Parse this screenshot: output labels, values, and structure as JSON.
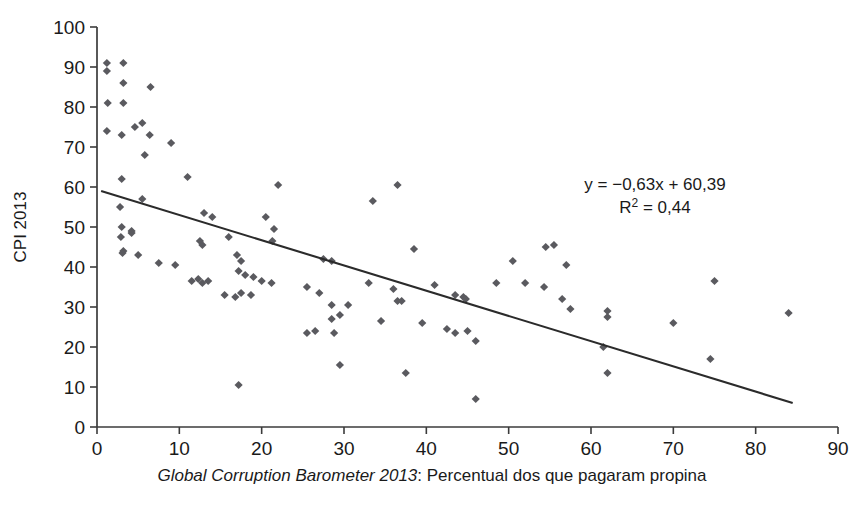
{
  "chart_data": {
    "type": "scatter",
    "title_visible_fragment": "",
    "xlabel_italic": "Global Corruption Barometer 2013",
    "xlabel_rest": ": Percentual dos que pagaram propina",
    "ylabel": "CPI 2013",
    "xlim": [
      0,
      90
    ],
    "ylim": [
      0,
      100
    ],
    "xticks": [
      0,
      10,
      20,
      30,
      40,
      50,
      60,
      70,
      80,
      90
    ],
    "yticks": [
      0,
      10,
      20,
      30,
      40,
      50,
      60,
      70,
      80,
      90,
      100
    ],
    "grid": false,
    "legend": "none",
    "marker_shape": "diamond",
    "marker_color": "#5a5a5f",
    "line_color": "#2b2b2b",
    "annotations": [
      "y = −0,63x + 60,39",
      "R² = 0,44"
    ],
    "equation": {
      "slope": -0.63,
      "intercept": 60.39,
      "r_squared": 0.44,
      "line_x_start": 0.5,
      "line_y_start": 59.0,
      "line_x_end": 84.5,
      "line_y_end": 6.0
    },
    "points": [
      [
        1.2,
        91.0
      ],
      [
        1.2,
        89.0
      ],
      [
        3.2,
        91.0
      ],
      [
        1.3,
        81.0
      ],
      [
        3.2,
        86.0
      ],
      [
        3.2,
        81.0
      ],
      [
        6.5,
        85.0
      ],
      [
        1.2,
        74.0
      ],
      [
        3.0,
        73.0
      ],
      [
        4.6,
        75.0
      ],
      [
        5.5,
        76.0
      ],
      [
        6.4,
        73.0
      ],
      [
        9.0,
        71.0
      ],
      [
        5.8,
        68.0
      ],
      [
        3.0,
        62.0
      ],
      [
        11.0,
        62.5
      ],
      [
        22.0,
        60.5
      ],
      [
        36.5,
        60.5
      ],
      [
        2.8,
        55.0
      ],
      [
        5.5,
        57.0
      ],
      [
        13.0,
        53.5
      ],
      [
        14.0,
        52.5
      ],
      [
        3.0,
        50.0
      ],
      [
        4.2,
        49.0
      ],
      [
        4.2,
        48.5
      ],
      [
        20.5,
        52.5
      ],
      [
        21.5,
        49.5
      ],
      [
        16.0,
        47.5
      ],
      [
        33.5,
        56.5
      ],
      [
        21.3,
        46.5
      ],
      [
        2.9,
        47.5
      ],
      [
        3.2,
        44.0
      ],
      [
        3.1,
        43.5
      ],
      [
        12.5,
        46.5
      ],
      [
        12.8,
        45.5
      ],
      [
        5.0,
        43.0
      ],
      [
        7.5,
        41.0
      ],
      [
        12.3,
        37.0
      ],
      [
        12.8,
        36.0
      ],
      [
        13.5,
        36.5
      ],
      [
        17.0,
        43.0
      ],
      [
        17.5,
        41.5
      ],
      [
        17.2,
        39.0
      ],
      [
        18.0,
        38.0
      ],
      [
        19.0,
        37.5
      ],
      [
        20.0,
        36.5
      ],
      [
        21.2,
        36.0
      ],
      [
        17.5,
        33.5
      ],
      [
        18.7,
        33.0
      ],
      [
        15.5,
        33.0
      ],
      [
        16.8,
        32.5
      ],
      [
        27.5,
        42.0
      ],
      [
        28.5,
        41.5
      ],
      [
        25.5,
        35.0
      ],
      [
        27.0,
        33.5
      ],
      [
        28.5,
        30.5
      ],
      [
        30.5,
        30.5
      ],
      [
        29.5,
        28.0
      ],
      [
        28.5,
        27.0
      ],
      [
        25.5,
        23.5
      ],
      [
        26.5,
        24.0
      ],
      [
        28.8,
        23.5
      ],
      [
        29.5,
        15.5
      ],
      [
        33.0,
        36.0
      ],
      [
        36.0,
        34.5
      ],
      [
        36.5,
        31.5
      ],
      [
        37.0,
        31.5
      ],
      [
        34.5,
        26.5
      ],
      [
        38.5,
        44.5
      ],
      [
        39.5,
        26.0
      ],
      [
        37.5,
        13.5
      ],
      [
        41.0,
        35.5
      ],
      [
        43.5,
        33.0
      ],
      [
        44.5,
        32.5
      ],
      [
        44.8,
        32.0
      ],
      [
        42.5,
        24.5
      ],
      [
        43.5,
        23.5
      ],
      [
        45.0,
        24.0
      ],
      [
        46.0,
        21.5
      ],
      [
        46.0,
        7.0
      ],
      [
        50.5,
        41.5
      ],
      [
        48.5,
        36.0
      ],
      [
        52.0,
        36.0
      ],
      [
        54.5,
        45.0
      ],
      [
        54.3,
        35.0
      ],
      [
        55.5,
        45.5
      ],
      [
        57.0,
        40.5
      ],
      [
        56.5,
        32.0
      ],
      [
        57.5,
        29.5
      ],
      [
        62.0,
        29.0
      ],
      [
        62.0,
        27.5
      ],
      [
        61.5,
        20.0
      ],
      [
        62.0,
        13.5
      ],
      [
        70.0,
        26.0
      ],
      [
        75.0,
        36.5
      ],
      [
        74.5,
        17.0
      ],
      [
        84.0,
        28.5
      ],
      [
        17.2,
        10.5
      ],
      [
        9.5,
        40.5
      ],
      [
        11.5,
        36.5
      ]
    ]
  }
}
